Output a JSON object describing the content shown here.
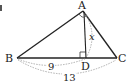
{
  "figure": {
    "points": {
      "A": {
        "label": "A",
        "x": 83,
        "y": 11
      },
      "B": {
        "label": "B",
        "x": 17,
        "y": 58
      },
      "C": {
        "label": "C",
        "x": 117,
        "y": 58
      },
      "D": {
        "label": "D",
        "x": 86,
        "y": 58
      }
    },
    "measurements": {
      "BD": "9",
      "BC": "13",
      "AD": "x"
    },
    "colors": {
      "line": "#222222",
      "dashed": "#9a9a9a"
    }
  }
}
